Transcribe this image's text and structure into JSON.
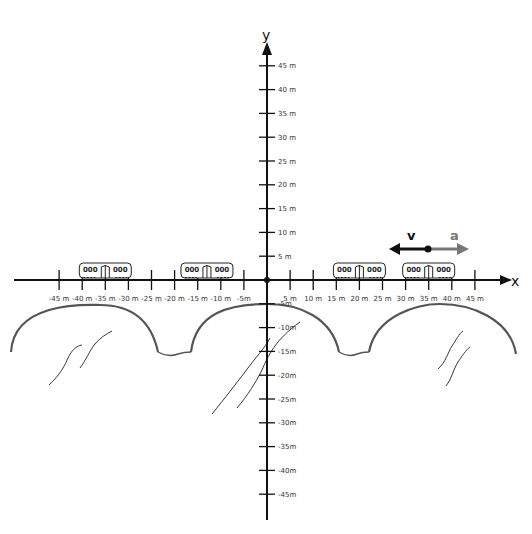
{
  "diagram": {
    "axes": {
      "x_label": "x",
      "y_label": "y",
      "origin_px": [
        267,
        280
      ],
      "x_px_per_m": 4.62,
      "y_px_per_m": 4.76,
      "x_ticks": [
        "-45 m",
        "-40 m",
        "-35 m",
        "-30 m",
        "-25 m",
        "-20 m",
        "-15 m",
        "-10 m",
        "-5m",
        "5 m",
        "10 m",
        "15 m",
        "20 m",
        "25 m",
        "30 m",
        "35 m",
        "40 m",
        "45 m"
      ],
      "y_ticks_positive": [
        "5 m",
        "10 m",
        "15 m",
        "20 m",
        "25 m",
        "30 m",
        "35 m",
        "40 m",
        "45 m"
      ],
      "y_ticks_negative": [
        "-5m",
        "-10m",
        "-15m",
        "-20m",
        "-25m",
        "-30m",
        "-35m",
        "-40m",
        "-45m"
      ]
    },
    "trains": [
      {
        "label_left": "000",
        "label_right": "000",
        "center_m": -35
      },
      {
        "label_left": "000",
        "label_right": "000",
        "center_m": -13
      },
      {
        "label_left": "000",
        "label_right": "000",
        "center_m": 20
      },
      {
        "label_left": "000",
        "label_right": "000",
        "center_m": 35
      }
    ],
    "vectors": {
      "velocity": {
        "label": "v",
        "direction": "left",
        "color": "#111111"
      },
      "acceleration": {
        "label": "a",
        "direction": "right",
        "color": "#777777"
      }
    },
    "terrain": {
      "hills": 3,
      "color": "#555555"
    }
  }
}
